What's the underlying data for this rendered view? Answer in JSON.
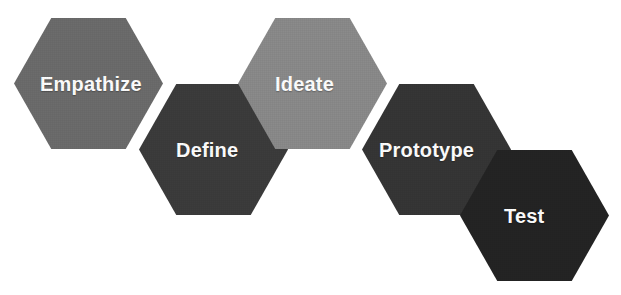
{
  "diagram": {
    "background_color": "#ffffff",
    "label_color": "#ffffff",
    "steps": [
      {
        "label": "Empathize",
        "color": "#6c6c6c",
        "order": 1,
        "x": 14,
        "y": 18,
        "width": 149,
        "height": 131,
        "label_offset_x": 26,
        "font_size": 20
      },
      {
        "label": "Define",
        "color": "#3d3d3d",
        "order": 2,
        "x": 139,
        "y": 84,
        "width": 149,
        "height": 131,
        "label_offset_x": 37,
        "font_size": 20
      },
      {
        "label": "Ideate",
        "color": "#8b8b8b",
        "order": 3,
        "x": 238,
        "y": 18,
        "width": 149,
        "height": 131,
        "label_offset_x": 37,
        "font_size": 20
      },
      {
        "label": "Prototype",
        "color": "#363636",
        "order": 4,
        "x": 362,
        "y": 84,
        "width": 149,
        "height": 131,
        "label_offset_x": 17,
        "font_size": 20
      },
      {
        "label": "Test",
        "color": "#242424",
        "order": 5,
        "x": 460,
        "y": 150,
        "width": 149,
        "height": 131,
        "label_offset_x": 44,
        "font_size": 20
      }
    ]
  }
}
